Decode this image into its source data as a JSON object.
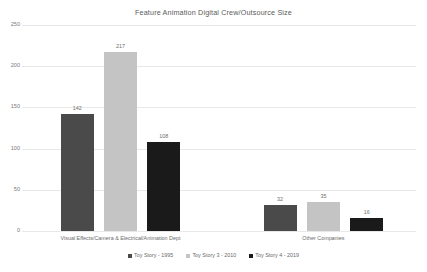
{
  "chart_data": {
    "type": "bar",
    "title": "Feature Animation Digital Crew/Outsource Size",
    "xlabel": "",
    "ylabel": "",
    "ylim": [
      0,
      250
    ],
    "yticks": [
      0,
      50,
      100,
      150,
      200,
      250
    ],
    "ytick_labels": [
      "0",
      "50",
      "100",
      "150",
      "200",
      "250"
    ],
    "grid": true,
    "legend_position": "bottom",
    "categories": [
      "Visual Effects/Camera & Electrical/Animation Dept",
      "Other Companies"
    ],
    "series": [
      {
        "name": "Toy Story - 1995",
        "color": "#4a4a4a",
        "values": [
          142,
          32
        ],
        "labels": [
          "142",
          "32"
        ]
      },
      {
        "name": "Toy Story 3 - 2010",
        "color": "#c4c4c4",
        "values": [
          217,
          35
        ],
        "labels": [
          "217",
          "35"
        ]
      },
      {
        "name": "Toy Story 4 - 2019",
        "color": "#1a1a1a",
        "values": [
          108,
          16
        ],
        "labels": [
          "108",
          "16"
        ]
      }
    ]
  },
  "colors": {
    "background": "#ffffff",
    "gridline": "#e8e8e8",
    "text": "#6a6a6a",
    "series_1": "#4a4a4a",
    "series_2": "#c4c4c4",
    "series_3": "#1a1a1a"
  }
}
